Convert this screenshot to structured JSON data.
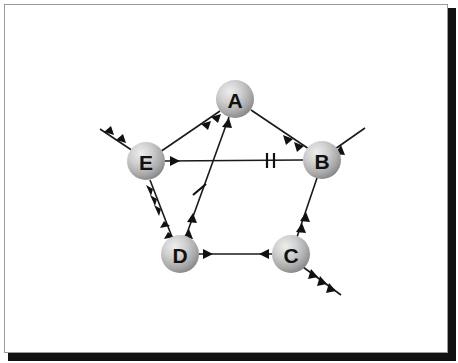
{
  "figure": {
    "background_color": "#ffffff",
    "frame_border_color": "#9a9a9a",
    "shadow_color": "#111111",
    "node_fill_light": "#e2e2e2",
    "node_fill_dark": "#8d8d8d",
    "edge_color": "#1a1a1a",
    "label_color": "#111111"
  },
  "nodes": [
    {
      "id": "A",
      "label": "A",
      "cx": 230,
      "cy": 94,
      "r": 19
    },
    {
      "id": "B",
      "label": "B",
      "cx": 317,
      "cy": 155,
      "r": 19
    },
    {
      "id": "C",
      "label": "C",
      "cx": 286,
      "cy": 249,
      "r": 19
    },
    {
      "id": "D",
      "label": "D",
      "cx": 175,
      "cy": 249,
      "r": 19
    },
    {
      "id": "E",
      "label": "E",
      "cx": 141,
      "cy": 156,
      "r": 19
    }
  ],
  "edges": [
    {
      "id": "edge-A-E",
      "from": "A",
      "to": "E",
      "direction": "A-to-E",
      "arrowheads": 2,
      "arrowhead_position": "near-A",
      "tick_marks": 0
    },
    {
      "id": "edge-A-B",
      "from": "A",
      "to": "B",
      "direction": "A-to-B",
      "arrowheads": 2,
      "arrowhead_position": "near-B",
      "tick_marks": 0
    },
    {
      "id": "edge-E-B",
      "from": "E",
      "to": "B",
      "direction": "E-to-B",
      "arrowheads": 1,
      "arrowhead_position": "near-E",
      "tick_marks": 2
    },
    {
      "id": "edge-D-A",
      "from": "D",
      "to": "A",
      "direction": "bidirectional",
      "arrowheads": 3,
      "arrowhead_position": "near-A-and-near-D",
      "tick_marks": 1
    },
    {
      "id": "edge-E-D",
      "from": "E",
      "to": "D",
      "direction": "bidirectional",
      "arrowheads": 5,
      "arrowhead_position": "near-E-and-near-D",
      "tick_marks": 0
    },
    {
      "id": "edge-B-C",
      "from": "B",
      "to": "C",
      "direction": "C-to-B",
      "arrowheads": 2,
      "arrowhead_position": "near-C",
      "tick_marks": 0
    },
    {
      "id": "edge-D-C",
      "from": "D",
      "to": "C",
      "direction": "bidirectional",
      "arrowheads": 2,
      "arrowhead_position": "near-D-and-near-C",
      "tick_marks": 0
    }
  ],
  "external_arrows": [
    {
      "id": "external-arrow-E",
      "node": "E",
      "direction": "up-left",
      "outgoing": true,
      "arrowheads": 2
    },
    {
      "id": "external-arrow-B",
      "node": "B",
      "direction": "up-right",
      "outgoing": true,
      "arrowheads": 1
    },
    {
      "id": "external-arrow-C",
      "node": "C",
      "direction": "down-right",
      "outgoing": true,
      "arrowheads": 3
    }
  ]
}
